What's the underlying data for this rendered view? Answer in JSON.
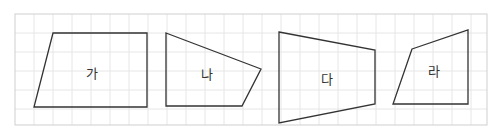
{
  "diagram": {
    "type": "quadrilaterals-on-grid",
    "grid": {
      "x": 15,
      "y": 14,
      "width": 472,
      "height": 111,
      "cell": 19,
      "line_color": "#e6e6e6",
      "border_color": "#cfcfcf"
    },
    "stroke_color": "#333333",
    "shapes": [
      {
        "id": "ga",
        "label": "가",
        "points": "53,33 147,33 147,107 34,107",
        "label_x": 92,
        "label_y": 72
      },
      {
        "id": "na",
        "label": "나",
        "points": "166,33 261,69 242,106 166,106",
        "label_x": 207,
        "label_y": 73
      },
      {
        "id": "da",
        "label": "다",
        "points": "279,32 375,50 375,104 279,123",
        "label_x": 327,
        "label_y": 78
      },
      {
        "id": "ra",
        "label": "라",
        "points": "412,49 468,30 468,104 393,104",
        "label_x": 434,
        "label_y": 70
      }
    ]
  }
}
